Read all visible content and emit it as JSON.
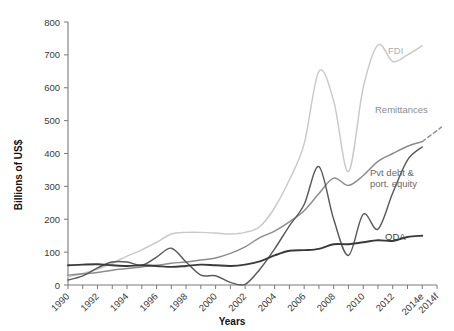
{
  "chart_data": {
    "type": "line",
    "title": "",
    "xlabel": "Years",
    "ylabel": "Billions of US$",
    "ylim": [
      0,
      800
    ],
    "ytick_values": [
      0,
      100,
      200,
      300,
      400,
      500,
      600,
      700,
      800
    ],
    "ytick_labels": [
      "0",
      "100",
      "200",
      "300",
      "400",
      "500",
      "600",
      "700",
      "800"
    ],
    "grid": false,
    "legend_position": "inline-right-of-series",
    "x": [
      1990,
      1991,
      1992,
      1993,
      1994,
      1995,
      1996,
      1997,
      1998,
      1999,
      2000,
      2001,
      2002,
      2003,
      2004,
      2005,
      2006,
      2007,
      2008,
      2009,
      2010,
      2011,
      2012,
      2013,
      2014
    ],
    "xtick_labels": [
      "1990",
      "1992",
      "1994",
      "1996",
      "1998",
      "2000",
      "2002",
      "2004",
      "2006",
      "2008",
      "2010",
      "2012",
      "2014e",
      "2014f"
    ],
    "xtick_values": [
      1990,
      1992,
      1994,
      1996,
      1998,
      2000,
      2002,
      2004,
      2006,
      2008,
      2010,
      2012,
      2014,
      2015
    ],
    "series": [
      {
        "name": "FDI",
        "label": "FDI",
        "color": "#c9c9c9",
        "style": "solid",
        "values": [
          25,
          35,
          48,
          66,
          88,
          107,
          130,
          155,
          160,
          160,
          158,
          155,
          160,
          178,
          235,
          320,
          430,
          650,
          560,
          345,
          600,
          730,
          680,
          700,
          728
        ]
      },
      {
        "name": "Remittances",
        "label": "Remittances",
        "color": "#8c8c8c",
        "style": "solid",
        "values": [
          30,
          34,
          38,
          45,
          50,
          55,
          60,
          66,
          70,
          76,
          82,
          96,
          116,
          144,
          164,
          192,
          226,
          278,
          325,
          303,
          333,
          376,
          400,
          422,
          436
        ],
        "forecast_label": "2014f",
        "forecast_value": 480,
        "forecast_style": "dashed"
      },
      {
        "name": "Pvt debt & port. equity",
        "label_line1": "Pvt debt &",
        "label_line2": "port. equity",
        "color": "#5a5a5a",
        "style": "solid",
        "values": [
          15,
          28,
          52,
          70,
          70,
          60,
          85,
          112,
          70,
          30,
          28,
          8,
          2,
          48,
          110,
          180,
          245,
          360,
          200,
          90,
          215,
          170,
          280,
          380,
          420
        ]
      },
      {
        "name": "ODA",
        "label": "ODA",
        "color": "#3a3a3a",
        "style": "solid",
        "values": [
          60,
          62,
          63,
          60,
          58,
          60,
          58,
          55,
          58,
          62,
          60,
          58,
          62,
          72,
          90,
          104,
          106,
          110,
          124,
          124,
          130,
          136,
          134,
          146,
          150
        ]
      }
    ],
    "annotations": []
  }
}
